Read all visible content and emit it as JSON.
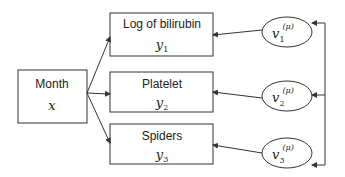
{
  "diagram": {
    "input_node": {
      "label": "Month",
      "symbol": "x"
    },
    "outcome_nodes": [
      {
        "label": "Log of bilirubin",
        "symbol": "y",
        "subscript": "1"
      },
      {
        "label": "Platelet",
        "symbol": "y",
        "subscript": "2"
      },
      {
        "label": "Spiders",
        "symbol": "y",
        "subscript": "3"
      }
    ],
    "latent_nodes": [
      {
        "symbol": "v",
        "subscript": "1",
        "superscript": "(μ)"
      },
      {
        "symbol": "v",
        "subscript": "2",
        "superscript": "(μ)"
      },
      {
        "symbol": "v",
        "subscript": "3",
        "superscript": "(μ)"
      }
    ],
    "colors": {
      "stroke": "#333333",
      "text": "#222222",
      "background": "#ffffff"
    }
  }
}
